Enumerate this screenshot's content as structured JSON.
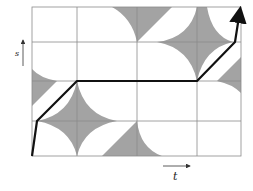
{
  "diagram": {
    "type": "configuration-space path",
    "axes": {
      "vertical_label": "s",
      "horizontal_label": "t"
    },
    "grid": {
      "columns": 4,
      "rows": 4
    },
    "colors": {
      "obstacle_fill": "#a3a3a3",
      "grid_line": "#8a8a8a",
      "path": "#111111",
      "axis_arrow": "#333333"
    },
    "path_description": "monotone path from bottom-left to top-right avoiding shaded obstacle regions"
  }
}
